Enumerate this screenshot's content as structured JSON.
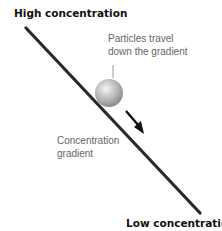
{
  "diagram": {
    "labels": {
      "high": "High concentration",
      "low": "Low concentration",
      "particles_line1": "Particles travel",
      "particles_line2": "down the gradient",
      "gradient_line1": "Concentration",
      "gradient_line2": "gradient"
    },
    "colors": {
      "line": "#2a2a2a",
      "ball_light": "#f4f4f4",
      "ball_dark": "#8c8c8c",
      "arrow": "#111111",
      "text_light": "#666666",
      "text_bold": "#111111"
    }
  }
}
